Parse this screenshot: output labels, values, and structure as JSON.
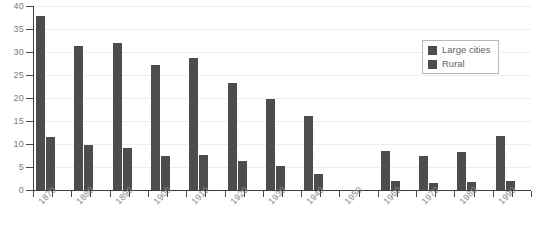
{
  "chart_data": {
    "type": "bar",
    "title": "",
    "subtitle": "",
    "xlabel": "",
    "ylabel": "",
    "categories": [
      "1870",
      "1880",
      "1890",
      "1900",
      "1910",
      "1920",
      "1930",
      "1940",
      "1950",
      "1960",
      "1970",
      "1980",
      "1990"
    ],
    "series": [
      {
        "name": "Large cities",
        "values": [
          37.8,
          31.3,
          32.0,
          27.2,
          28.7,
          23.3,
          19.8,
          16.0,
          null,
          8.5,
          7.3,
          8.2,
          11.8
        ]
      },
      {
        "name": "Rural",
        "values": [
          11.6,
          9.8,
          9.1,
          7.5,
          7.6,
          6.4,
          5.2,
          3.5,
          null,
          2.0,
          1.6,
          1.8,
          1.9
        ]
      }
    ],
    "ylim": [
      0,
      40
    ],
    "ytick_values": [
      0,
      5,
      10,
      15,
      20,
      25,
      30,
      35,
      40
    ],
    "ytick_labels": [
      "0",
      "5",
      "10",
      "15",
      "20",
      "25",
      "30",
      "35",
      "40"
    ],
    "grid": true,
    "legend_position": "upper right",
    "bar_color": "#4d4d4d",
    "gridline_color": "#ededed",
    "axis_color": "#3d3d3d",
    "missing_categories": [
      "1950"
    ]
  },
  "legend": {
    "items": [
      {
        "label": "Large cities"
      },
      {
        "label": "Rural"
      }
    ]
  },
  "caption": {
    "text": ""
  }
}
